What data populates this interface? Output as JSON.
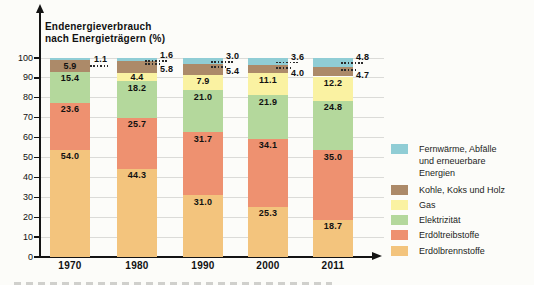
{
  "title_lines": [
    "Endenergieverbrauch",
    "nach Energieträgern (%)"
  ],
  "chart_data": {
    "type": "bar",
    "stacked": true,
    "title": "Endenergieverbrauch nach Energieträgern (%)",
    "categories": [
      "1970",
      "1980",
      "1990",
      "2000",
      "2011"
    ],
    "series": [
      {
        "name": "Erdölbrennstoffe",
        "color": "#f3c47d",
        "values": [
          54.0,
          44.3,
          31.0,
          25.3,
          18.7
        ],
        "labels": [
          "inside",
          "inside",
          "inside",
          "inside",
          "inside"
        ]
      },
      {
        "name": "Erdöltreibstoffe",
        "color": "#ee9170",
        "values": [
          23.6,
          25.7,
          31.7,
          34.1,
          35.0
        ],
        "labels": [
          "inside",
          "inside",
          "inside",
          "inside",
          "inside"
        ]
      },
      {
        "name": "Elektrizität",
        "color": "#b4d89c",
        "values": [
          15.4,
          18.2,
          21.0,
          21.9,
          24.8
        ],
        "labels": [
          "inside",
          "inside",
          "inside",
          "inside",
          "inside"
        ]
      },
      {
        "name": "Gas",
        "color": "#faf2a2",
        "values": [
          null,
          4.4,
          7.9,
          11.1,
          12.2
        ],
        "labels": [
          null,
          "inside",
          "inside",
          "inside",
          "inside"
        ]
      },
      {
        "name": "Kohle, Koks und Holz",
        "color": "#ac8a69",
        "values": [
          5.9,
          5.8,
          5.4,
          4.0,
          4.7
        ],
        "labels": [
          "inside",
          "callout",
          "callout",
          "callout",
          "callout"
        ]
      },
      {
        "name": "Fernwärme, Abfälle und erneuerbare Energien",
        "color": "#90cdd5",
        "values": [
          1.1,
          1.6,
          3.0,
          3.6,
          4.8
        ],
        "labels": [
          "callout-side",
          "callout",
          "callout",
          "callout",
          "callout"
        ]
      }
    ],
    "ylim": [
      0,
      100
    ],
    "yticks": [
      0,
      10,
      20,
      30,
      40,
      50,
      60,
      70,
      80,
      90,
      100
    ],
    "grid": true,
    "legend_position": "right"
  },
  "legend": {
    "entries": [
      {
        "lines": [
          "Fernwärme, Abfälle",
          "und erneuerbare",
          "Energien"
        ],
        "color": "#90cdd5"
      },
      {
        "lines": [
          "Kohle, Koks und Holz"
        ],
        "color": "#ac8a69"
      },
      {
        "lines": [
          "Gas"
        ],
        "color": "#faf2a2"
      },
      {
        "lines": [
          "Elektrizität"
        ],
        "color": "#b4d89c"
      },
      {
        "lines": [
          "Erdöltreibstoffe"
        ],
        "color": "#ee9170"
      },
      {
        "lines": [
          "Erdölbrennstoffe"
        ],
        "color": "#f3c47d"
      }
    ]
  }
}
